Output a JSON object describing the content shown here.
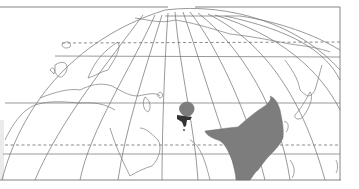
{
  "map": {
    "title": "",
    "type": "distribution-range-map",
    "projection": "oblique globe graticule (Eurasia / Africa)",
    "background_color": "#ffffff",
    "line_color": "#6d6d6d",
    "range_fill_color": "#7d7d7d",
    "marker_color": "#333333",
    "regions_depicted": [
      "Europe",
      "North Africa",
      "Arabian Peninsula",
      "Central Asia",
      "South Asia",
      "East Asia",
      "Southeast Asia",
      "Japan"
    ],
    "range_areas": [
      {
        "name": "main-range",
        "description": "East Asia / China / Indochina / eastern India"
      },
      {
        "name": "central-asia-patch",
        "description": "small isolated patch in Central Asia"
      }
    ],
    "special_markers": [
      {
        "name": "dark-marker",
        "description": "dark anchor-shaped marker below central-asia patch"
      }
    ],
    "graticule": {
      "dashed_parallels": 2,
      "solid_parallels": 3,
      "meridians": 12
    }
  }
}
